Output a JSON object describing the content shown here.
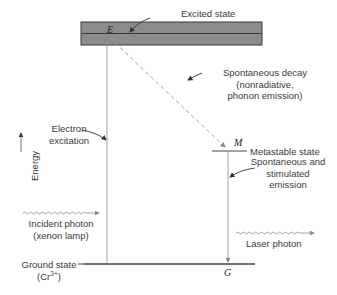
{
  "diagram": {
    "type": "energy-level-diagram",
    "axis_label": "Energy",
    "levels": {
      "excited": {
        "symbol": "E",
        "label": "Excited state"
      },
      "metastable": {
        "symbol": "M",
        "label": "Metastable state"
      },
      "ground": {
        "symbol": "G",
        "label_line1": "Ground state",
        "label_line2_prefix": "(Cr",
        "label_line2_sup": "3+",
        "label_line2_suffix": ")"
      }
    },
    "transitions": {
      "excitation": {
        "line1": "Electron",
        "line2": "excitation"
      },
      "decay": {
        "line1": "Spontaneous decay",
        "line2": "(nonradiative,",
        "line3": "phonon emission)"
      },
      "emission": {
        "line1": "Spontaneous and",
        "line2": "stimulated",
        "line3": "emission"
      }
    },
    "photons": {
      "incident": {
        "line1": "Incident photon",
        "line2": "(xenon lamp)"
      },
      "laser": {
        "label": "Laser photon"
      }
    },
    "colors": {
      "band_fill": "#8a8a8a",
      "band_stroke": "#3a3a3a",
      "line": "#444444",
      "arrow_light": "#9a9a9a",
      "text": "#3a3a3a"
    }
  }
}
